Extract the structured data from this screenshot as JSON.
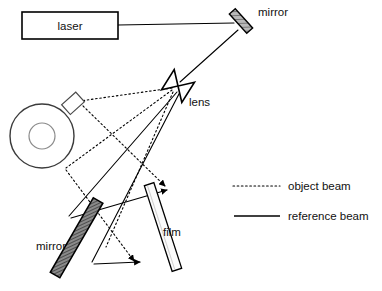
{
  "diagram": {
    "background_color": "#ffffff",
    "line_color": "#000000",
    "labels": {
      "laser": "laser",
      "mirror_top": "mirror",
      "lens": "lens",
      "mirror_bottom": "mirror",
      "film": "film"
    },
    "components": {
      "laser_box": {
        "x": 22,
        "y": 12,
        "width": 96,
        "height": 27,
        "label": "laser"
      },
      "mirror_top": {
        "cx": 241,
        "cy": 21,
        "length": 26,
        "thickness": 8,
        "angle_deg": 48,
        "fill": "#9a9a9a"
      },
      "lens": {
        "cx": 178,
        "cy": 85,
        "label": "lens",
        "shape": "biconvex-bowtie",
        "angle_deg": 35
      },
      "object_cup": {
        "cx": 42,
        "cy": 136,
        "outer_r": 32,
        "inner_r": 13,
        "handle": true
      },
      "mirror_bottom": {
        "x1": 58,
        "y1": 205,
        "x2": 97,
        "y2": 272,
        "thickness": 10,
        "fill": "#6f6f6f"
      },
      "film": {
        "x1": 178,
        "y1": 183,
        "x2": 149,
        "y2": 271,
        "thickness": 9,
        "fill": "#fbfbfb"
      }
    },
    "legend": {
      "items": [
        {
          "style": "dotted",
          "label": "object beam",
          "color": "#000000"
        },
        {
          "style": "solid",
          "label": "reference beam",
          "color": "#000000"
        }
      ]
    },
    "beams": {
      "object_beam_style": "dotted",
      "reference_beam_style": "solid"
    }
  }
}
